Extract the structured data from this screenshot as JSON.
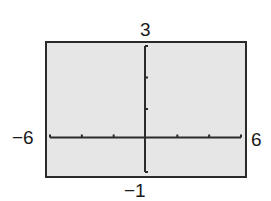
{
  "chart_data": {
    "type": "line",
    "title": "",
    "xlabel": "",
    "ylabel": "",
    "window": {
      "xmin": -6,
      "xmax": 6,
      "ymin": -1,
      "ymax": 3
    },
    "xlim": [
      -6,
      6
    ],
    "ylim": [
      -1,
      3
    ],
    "x_ticks": [
      -6,
      -4,
      -2,
      0,
      2,
      4,
      6
    ],
    "y_ticks": [
      -1,
      0,
      1,
      2,
      3
    ],
    "series": [],
    "grid": false,
    "labels": {
      "xmin": "−6",
      "xmax": "6",
      "ymin": "−1",
      "ymax": "3"
    },
    "colors": {
      "background": "#e6e6e6",
      "frame": "#2a2a2a",
      "axes": "#2a2a2a"
    }
  }
}
